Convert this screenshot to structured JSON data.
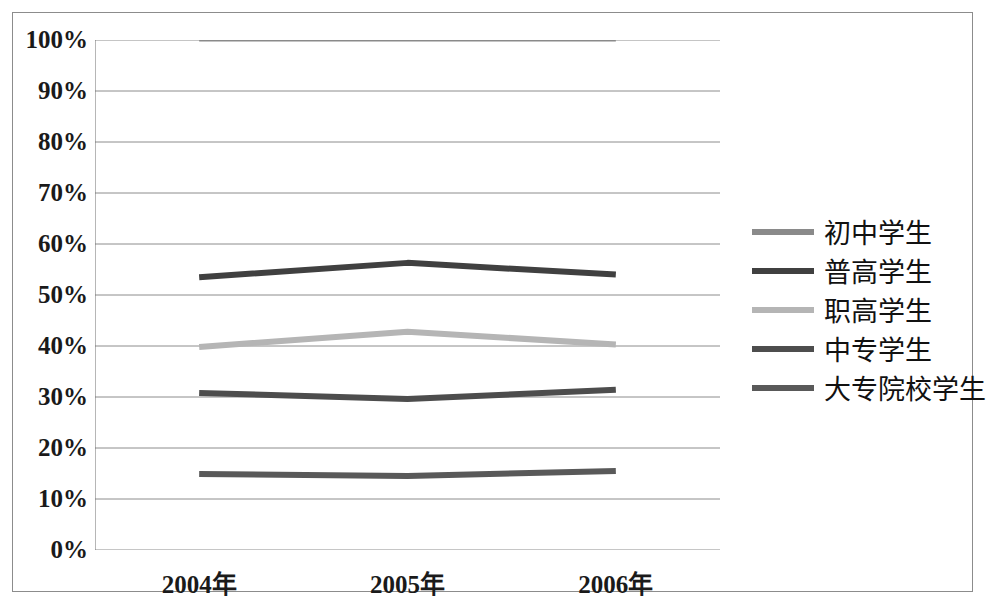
{
  "chart_data": {
    "type": "line",
    "title": "",
    "subtitle": "",
    "xlabel": "",
    "ylabel": "",
    "categories": [
      "2004年",
      "2005年",
      "2006年"
    ],
    "x_tick_labels": [
      "2004年",
      "2005年",
      "2006年"
    ],
    "y_tick_labels": [
      "0%",
      "10%",
      "20%",
      "30%",
      "40%",
      "50%",
      "60%",
      "70%",
      "80%",
      "90%",
      "100%"
    ],
    "y_tick_values": [
      0,
      10,
      20,
      30,
      40,
      50,
      60,
      70,
      80,
      90,
      100
    ],
    "ylim": [
      0,
      100
    ],
    "grid": true,
    "grid_axis": "y",
    "legend_position": "right",
    "value_unit": "%",
    "series": [
      {
        "name": "初中学生",
        "color": "#8a8a8a",
        "line_width": 3,
        "values": [
          100,
          100,
          100
        ]
      },
      {
        "name": "普高学生",
        "color": "#404040",
        "line_width": 6,
        "values": [
          53.5,
          56.3,
          54
        ]
      },
      {
        "name": "职高学生",
        "color": "#b5b5b5",
        "line_width": 6,
        "values": [
          39.8,
          42.8,
          40.3
        ]
      },
      {
        "name": "中专学生",
        "color": "#4d4d4d",
        "line_width": 6,
        "values": [
          30.8,
          29.6,
          31.4
        ]
      },
      {
        "name": "大专院校学生",
        "color": "#595959",
        "line_width": 6,
        "values": [
          14.9,
          14.5,
          15.5
        ]
      }
    ]
  },
  "legend": {
    "items": [
      {
        "label": "初中学生",
        "color": "#8a8a8a"
      },
      {
        "label": "普高学生",
        "color": "#404040"
      },
      {
        "label": "职高学生",
        "color": "#b5b5b5"
      },
      {
        "label": "中专学生",
        "color": "#4d4d4d"
      },
      {
        "label": "大专院校学生",
        "color": "#595959"
      }
    ]
  },
  "axes": {
    "grid_color": "#8c8c8c",
    "axis_color": "#6e6e6e",
    "frame_color": "#8c8c8c"
  }
}
